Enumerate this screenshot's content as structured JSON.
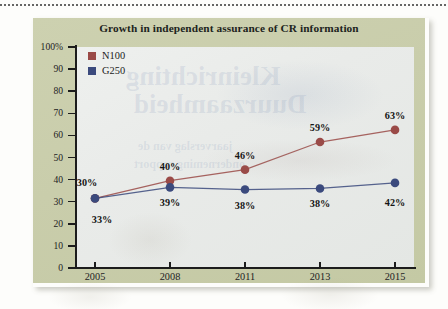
{
  "chart_data": {
    "type": "line",
    "title": "Growth in independent assurance of CR information",
    "xlabel": "",
    "ylabel": "",
    "ylim": [
      0,
      100
    ],
    "grid": false,
    "legend_position": "top-left",
    "categories": [
      "2005",
      "2008",
      "2011",
      "2013",
      "2015"
    ],
    "ytick_labels": [
      "100%",
      "90",
      "80",
      "70",
      "60",
      "50",
      "40",
      "30",
      "20",
      "10",
      "0"
    ],
    "ytick_values": [
      100,
      90,
      80,
      70,
      60,
      50,
      40,
      30,
      20,
      10,
      0
    ],
    "series": [
      {
        "name": "N100",
        "color": "#9a4a47",
        "values": [
          30,
          40,
          46,
          59,
          63
        ],
        "plotted": [
          31.5,
          39.5,
          44.5,
          57,
          62.5
        ],
        "labels": [
          "30%",
          "40%",
          "46%",
          "59%",
          "63%"
        ],
        "label_side": [
          "above",
          "above",
          "above",
          "above",
          "above"
        ]
      },
      {
        "name": "G250",
        "color": "#3b4a7d",
        "values": [
          33,
          39,
          38,
          38,
          42
        ],
        "plotted": [
          31.5,
          36.5,
          35.5,
          36,
          38.5
        ],
        "labels": [
          "33%",
          "39%",
          "38%",
          "38%",
          "42%"
        ],
        "label_side": [
          "below",
          "below",
          "below",
          "below",
          "below"
        ]
      }
    ]
  },
  "figure": {
    "panel_color": "#c9cdab",
    "plot_background": "#e9ebe9"
  },
  "watermark": {
    "line1": "Kleinrichting",
    "line2": "Duurzaamheid",
    "line3": "jaarverslag van de",
    "line4": "onderneming rapport"
  }
}
